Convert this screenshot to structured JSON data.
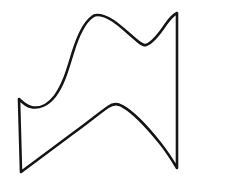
{
  "canvas": {
    "width": 229,
    "height": 183,
    "background_color": "#ffffff"
  },
  "figure": {
    "name": "wavy-banner-outline",
    "stroke_color": "#141414",
    "stroke_width": 2.6,
    "fill": "none",
    "vertices": {
      "top_peak": [
        97,
        15
      ],
      "top_valley": [
        145,
        45
      ],
      "spike_tip": [
        177,
        13
      ],
      "right_bottom": [
        177,
        168
      ],
      "lower_hump_peak": [
        113,
        105
      ],
      "bottom_left": [
        21,
        172
      ],
      "left_top_corner": [
        19,
        99
      ],
      "left_notch_low": [
        35,
        107
      ]
    },
    "path": "M 97 15 C 110 15 122 28 134 38 C 140 43 143 46 146 45 C 152 43 160 33 166 24 C 171 17 175 14 177 13 L 177 168 C 174 163 168 153 160 143 C 148 128 133 112 122 106 C 117 103 112 104 108 107 C 98 114 86 124 72 134 C 53 148 33 163 21 172 L 19 99 C 22 102 26 106 31 107 C 39 109 48 105 55 96 C 64 84 68 68 73 52 C 78 36 85 22 92 17 C 94 15 96 15 97 15 Z"
  }
}
